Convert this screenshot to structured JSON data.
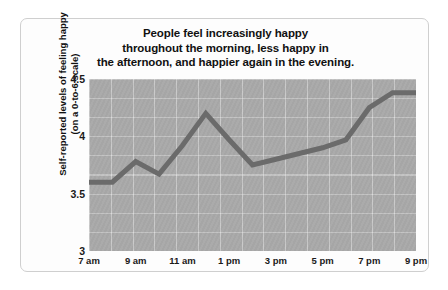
{
  "chart_data": {
    "type": "line",
    "title": "People feel increasingly happy throughout the morning, less happy in the afternoon, and happier again in the evening.",
    "title_lines": [
      "People feel increasingly happy",
      "throughout the morning, less happy in",
      "the afternoon, and happier again in the evening."
    ],
    "xlabel": "",
    "ylabel": "Self-reported levels of feeling happy (on a 0-to-6 scale)",
    "ylabel_lines": [
      "Self-reported levels of feeling happy",
      "(on a 0-to-6 scale)"
    ],
    "ylim": [
      3,
      4.5
    ],
    "yticks": [
      4.5,
      4,
      3.5,
      3
    ],
    "ytick_labels": [
      "4.5",
      "4",
      "3.5",
      "3"
    ],
    "xlim": [
      "7 am",
      "9 pm"
    ],
    "xticks": [
      7,
      9,
      11,
      13,
      15,
      17,
      19,
      21
    ],
    "xtick_labels": [
      "7 am",
      "9 am",
      "11 am",
      "1 pm",
      "3 pm",
      "5 pm",
      "7 pm",
      "9 pm"
    ],
    "grid": true,
    "legend": false,
    "x": [
      7,
      8,
      9,
      10,
      11,
      12,
      13,
      14,
      15,
      16,
      17,
      18,
      19,
      20,
      21
    ],
    "values": [
      3.6,
      3.6,
      3.78,
      3.67,
      3.92,
      4.2,
      3.97,
      3.75,
      3.8,
      3.85,
      3.9,
      3.97,
      4.25,
      4.38,
      4.38
    ],
    "series": [
      {
        "name": "Self-reported happiness",
        "color": "#6b6b6b",
        "values": [
          3.6,
          3.6,
          3.78,
          3.67,
          3.92,
          4.2,
          3.97,
          3.75,
          3.8,
          3.85,
          3.9,
          3.97,
          4.25,
          4.38,
          4.38
        ]
      }
    ],
    "colors": {
      "line": "#6b6b6b",
      "plot_background": "#a9a9a9",
      "gridline": "#ffffff",
      "card_background": "#fdfdfd",
      "card_border": "#cfcfcf",
      "text": "#111111"
    }
  }
}
